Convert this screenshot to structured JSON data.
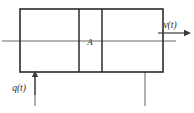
{
  "figure": {
    "type": "engineering-schematic",
    "labels": {
      "area": "A",
      "inflow": "q(t)",
      "outflow": "v(t)"
    },
    "colors": {
      "outline": "#2b2b2b",
      "axis": "#6b6b6b",
      "arrow": "#3a3a3a",
      "background": "#ffffff"
    },
    "geometry": {
      "vessel": {
        "x": 20,
        "y": 9,
        "width": 143,
        "height": 63
      },
      "dividers": [
        79,
        102
      ],
      "center_axis_y": 41,
      "legs_x": [
        35,
        145
      ],
      "leg_bottom_y": 106
    }
  }
}
